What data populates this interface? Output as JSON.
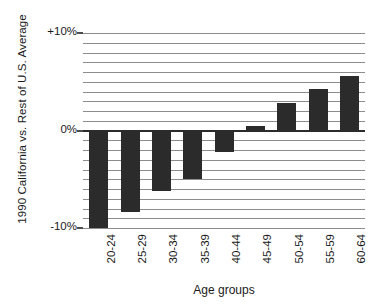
{
  "chart_data": {
    "type": "bar",
    "title": "",
    "subtitle": "",
    "xlabel": "Age groups",
    "ylabel": "1990 California vs. Rest of U.S. Average",
    "categories": [
      "20-24",
      "25-29",
      "30-34",
      "35-39",
      "40-44",
      "45-49",
      "50-54",
      "55-59",
      "60-64"
    ],
    "values": [
      -10.0,
      -8.4,
      -6.2,
      -5.0,
      -2.2,
      0.5,
      2.8,
      4.3,
      5.6
    ],
    "value_unit": "%",
    "ylim": [
      -10,
      10
    ],
    "ytick_labels": [
      "+10%",
      "0%",
      "-10%"
    ],
    "ytick_values": [
      10,
      0,
      -10
    ],
    "gridlines": true,
    "gridline_interval": 1,
    "legend": "none",
    "bar_color": "#2b2b2b",
    "grid_color": "#8c8c8c",
    "axis_color": "#2b2b2b"
  }
}
